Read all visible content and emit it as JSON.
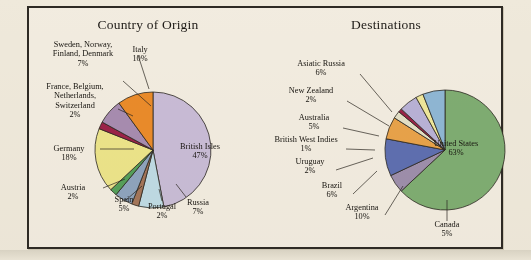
{
  "figure": {
    "background_color": "#f2ece0",
    "frame_color": "#2e2a24",
    "page_color": "#efe9db"
  },
  "chart_data": [
    {
      "type": "pie",
      "title": "Country of Origin",
      "labels": [
        "British Isles",
        "Russia",
        "Portugal",
        "Spain",
        "Austria",
        "Germany",
        "France, Belgium, Netherlands, Switzerland",
        "Sweden, Norway, Finland, Denmark",
        "Italy"
      ],
      "values": [
        47,
        7,
        2,
        5,
        2,
        18,
        2,
        7,
        10
      ],
      "value_suffix": "%",
      "colors": [
        "#c9bcd6",
        "#bfdbe4",
        "#a4765a",
        "#8fa4bd",
        "#56a05a",
        "#ece48a",
        "#9b2348",
        "#a78cb0",
        "#ea8b2a"
      ],
      "legend": "none",
      "slices": [
        {
          "label": "British Isles",
          "pct": "47%",
          "color": "#c9bcd6"
        },
        {
          "label": "Russia",
          "pct": "7%",
          "color": "#bfdbe4"
        },
        {
          "label": "Portugal",
          "pct": "2%",
          "color": "#a4765a"
        },
        {
          "label": "Spain",
          "pct": "5%",
          "color": "#8fa4bd"
        },
        {
          "label": "Austria",
          "pct": "2%",
          "color": "#56a05a"
        },
        {
          "label": "Germany",
          "pct": "18%",
          "color": "#ece48a"
        },
        {
          "label": "France, Belgium, Netherlands, Switzerland",
          "pct": "2%",
          "color": "#9b2348"
        },
        {
          "label": "Sweden, Norway, Finland, Denmark",
          "pct": "7%",
          "color": "#a78cb0"
        },
        {
          "label": "Italy",
          "pct": "10%",
          "color": "#ea8b2a"
        }
      ]
    },
    {
      "type": "pie",
      "title": "Destinations",
      "labels": [
        "United States",
        "Canada",
        "Argentina",
        "Brazil",
        "Uruguay",
        "British West Indies",
        "Australia",
        "New Zealand",
        "Asiatic Russia"
      ],
      "values": [
        63,
        5,
        10,
        6,
        2,
        1,
        5,
        2,
        6
      ],
      "value_suffix": "%",
      "colors": [
        "#7fad72",
        "#9e8fab",
        "#5f6fb0",
        "#e8a24a",
        "#e4e0c6",
        "#9b2348",
        "#b9b2d6",
        "#efe79a",
        "#8fb7d4"
      ],
      "legend": "none",
      "slices": [
        {
          "label": "United States",
          "pct": "63%",
          "color": "#7fad72"
        },
        {
          "label": "Canada",
          "pct": "5%",
          "color": "#9e8fab"
        },
        {
          "label": "Argentina",
          "pct": "10%",
          "color": "#5f6fb0"
        },
        {
          "label": "Brazil",
          "pct": "6%",
          "color": "#e8a24a"
        },
        {
          "label": "Uruguay",
          "pct": "2%",
          "color": "#e4e0c6"
        },
        {
          "label": "British West Indies",
          "pct": "1%",
          "color": "#9b2348"
        },
        {
          "label": "Australia",
          "pct": "5%",
          "color": "#b9b2d6"
        },
        {
          "label": "New Zealand",
          "pct": "2%",
          "color": "#efe79a"
        },
        {
          "label": "Asiatic Russia",
          "pct": "6%",
          "color": "#8fb7d4"
        }
      ]
    }
  ],
  "left_chart": {
    "title": "Country of Origin",
    "labels": {
      "scandinavia": {
        "name": "Sweden, Norway,\nFinland, Denmark",
        "line1": "Sweden, Norway,",
        "line2": "Finland, Denmark",
        "pct": "7%"
      },
      "italy": {
        "name": "Italy",
        "pct": "10%"
      },
      "france": {
        "line1": "France, Belgium,",
        "line2": "Netherlands,",
        "line3": "Switzerland",
        "pct": "2%"
      },
      "germany": {
        "name": "Germany",
        "pct": "18%"
      },
      "austria": {
        "name": "Austria",
        "pct": "2%"
      },
      "spain": {
        "name": "Spain",
        "pct": "5%"
      },
      "portugal": {
        "name": "Portugal",
        "pct": "2%"
      },
      "russia": {
        "name": "Russia",
        "pct": "7%"
      },
      "british_isles": {
        "name": "British Isles",
        "pct": "47%"
      }
    }
  },
  "right_chart": {
    "title": "Destinations",
    "labels": {
      "asiatic_russia": {
        "name": "Asiatic Russia",
        "pct": "6%"
      },
      "new_zealand": {
        "name": "New Zealand",
        "pct": "2%"
      },
      "australia": {
        "name": "Australia",
        "pct": "5%"
      },
      "bwi": {
        "name": "British West Indies",
        "pct": "1%"
      },
      "uruguay": {
        "name": "Uruguay",
        "pct": "2%"
      },
      "brazil": {
        "name": "Brazil",
        "pct": "6%"
      },
      "argentina": {
        "name": "Argentina",
        "pct": "10%"
      },
      "canada": {
        "name": "Canada",
        "pct": "5%"
      },
      "united_states": {
        "name": "United States",
        "pct": "63%"
      }
    }
  }
}
